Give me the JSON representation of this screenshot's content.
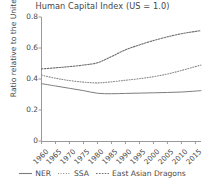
{
  "chart_data": {
    "type": "line",
    "title": "Human Capital Index (US = 1.0)",
    "subtitle": "",
    "xlabel": "",
    "ylabel": "Ratio relative to the United States",
    "xlim": [
      1960,
      2017
    ],
    "ylim": [
      0,
      0.8
    ],
    "grid": false,
    "legend_position": "bottom",
    "x_tick_labels": [
      "1960",
      "1965",
      "1970",
      "1975",
      "1980",
      "1985",
      "1990",
      "1995",
      "2000",
      "2005",
      "2010",
      "2015"
    ],
    "x_tick_values": [
      1960,
      1965,
      1970,
      1975,
      1980,
      1985,
      1990,
      1995,
      2000,
      2005,
      2010,
      2015
    ],
    "y_tick_labels": [
      "0",
      "0.2",
      "0.4",
      "0.6",
      "0.8"
    ],
    "y_tick_values": [
      0,
      0.2,
      0.4,
      0.6,
      0.8
    ],
    "x": [
      1960,
      1965,
      1970,
      1975,
      1980,
      1985,
      1990,
      1995,
      2000,
      2005,
      2010,
      2015,
      2017
    ],
    "series": [
      {
        "name": "NER",
        "style": "solid",
        "color": "#7d7d7d",
        "values": [
          0.37,
          0.355,
          0.34,
          0.325,
          0.308,
          0.305,
          0.307,
          0.309,
          0.311,
          0.313,
          0.316,
          0.322,
          0.325
        ]
      },
      {
        "name": "SSA",
        "style": "dotted",
        "color": "#8c8c8c",
        "values": [
          0.425,
          0.405,
          0.39,
          0.38,
          0.375,
          0.382,
          0.392,
          0.402,
          0.415,
          0.432,
          0.455,
          0.48,
          0.49
        ]
      },
      {
        "name": "East Asian Dragons",
        "style": "dashed-dotted",
        "color": "#6e6e6e",
        "values": [
          0.465,
          0.472,
          0.48,
          0.49,
          0.505,
          0.545,
          0.588,
          0.62,
          0.648,
          0.672,
          0.692,
          0.707,
          0.712
        ]
      }
    ]
  },
  "legend": {
    "items": [
      {
        "label": "NER",
        "style": "solid"
      },
      {
        "label": "SSA",
        "style": "dotted"
      },
      {
        "label": "East Asian Dragons",
        "style": "dashed-dotted"
      }
    ]
  }
}
